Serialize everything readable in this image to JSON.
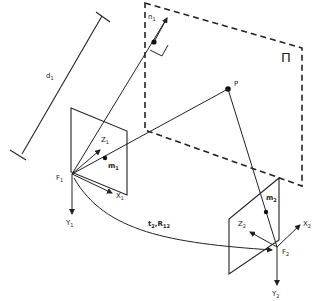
{
  "diagram": {
    "type": "two-view camera geometry with plane-induced homography",
    "plane": {
      "label": "Π"
    },
    "distance": {
      "label": "d",
      "sub": "1"
    },
    "normal": {
      "label": "n",
      "sub": "1"
    },
    "point": {
      "label": "P"
    },
    "camera1": {
      "center": {
        "label": "F",
        "sub": "1"
      },
      "axes": {
        "x": {
          "label": "X",
          "sub": "1"
        },
        "y": {
          "label": "Y",
          "sub": "1"
        },
        "z": {
          "label": "Z",
          "sub": "1"
        }
      },
      "projection": {
        "label": "m",
        "sub": "1"
      }
    },
    "camera2": {
      "center": {
        "label": "F",
        "sub": "2"
      },
      "axes": {
        "x": {
          "label": "X",
          "sub": "2"
        },
        "y": {
          "label": "Y",
          "sub": "2"
        },
        "z": {
          "label": "Z",
          "sub": "2"
        }
      },
      "projection": {
        "label": "m",
        "sub": "2"
      }
    },
    "transform": {
      "t": "t",
      "t_sub": "2",
      "sep": ",",
      "r": "R",
      "r_sub": "12"
    },
    "colors": {
      "stroke": "#222222",
      "background": "#ffffff"
    }
  }
}
